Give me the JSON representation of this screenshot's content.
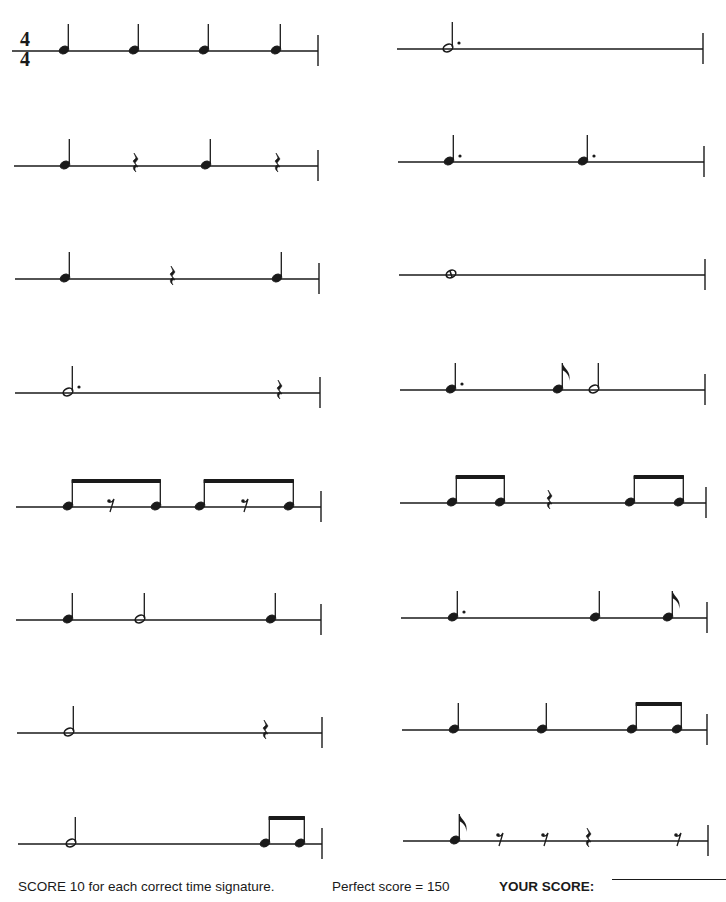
{
  "worksheet": {
    "time_signature": {
      "top": "4",
      "bottom": "4"
    },
    "footer": {
      "instruction": "SCORE 10 for each correct time signature.",
      "perfect_score": "Perfect score = 150",
      "your_score_label": "YOUR SCORE:"
    },
    "columns": [
      {
        "name": "left",
        "measures": [
          {
            "y": 51,
            "x1": 12,
            "x2": 318,
            "items": [
              {
                "t": "q",
                "x": 64
              },
              {
                "t": "q",
                "x": 134
              },
              {
                "t": "q",
                "x": 204
              },
              {
                "t": "q",
                "x": 276
              }
            ]
          },
          {
            "y": 166,
            "x1": 14,
            "x2": 318,
            "items": [
              {
                "t": "q",
                "x": 65
              },
              {
                "t": "qr",
                "x": 135
              },
              {
                "t": "q",
                "x": 206
              },
              {
                "t": "qr",
                "x": 277
              }
            ]
          },
          {
            "y": 279,
            "x1": 15,
            "x2": 319,
            "items": [
              {
                "t": "q",
                "x": 65
              },
              {
                "t": "qr",
                "x": 172
              },
              {
                "t": "q",
                "x": 277
              }
            ]
          },
          {
            "y": 393,
            "x1": 15,
            "x2": 320,
            "items": [
              {
                "t": "hd",
                "x": 68
              },
              {
                "t": "qr",
                "x": 279
              }
            ]
          },
          {
            "y": 507,
            "x1": 16,
            "x2": 321,
            "items": [
              {
                "t": "beam",
                "notes": [
                  68,
                  156
                ],
                "rest": {
                  "t": "er",
                  "x": 111
                }
              },
              {
                "t": "beam",
                "notes": [
                  200,
                  289
                ],
                "rest": {
                  "t": "er",
                  "x": 245
                }
              }
            ]
          },
          {
            "y": 620,
            "x1": 16,
            "x2": 321,
            "items": [
              {
                "t": "q",
                "x": 68
              },
              {
                "t": "h",
                "x": 140
              },
              {
                "t": "q",
                "x": 271
              }
            ]
          },
          {
            "y": 733,
            "x1": 17,
            "x2": 322,
            "items": [
              {
                "t": "h",
                "x": 69
              },
              {
                "t": "qr",
                "x": 265
              }
            ]
          },
          {
            "y": 844,
            "x1": 18,
            "x2": 322,
            "items": [
              {
                "t": "h",
                "x": 71
              },
              {
                "t": "beam",
                "notes": [
                  265,
                  300
                ]
              }
            ]
          }
        ]
      },
      {
        "name": "right",
        "measures": [
          {
            "y": 49,
            "x1": 397,
            "x2": 703,
            "items": [
              {
                "t": "hd",
                "x": 448
              }
            ]
          },
          {
            "y": 162,
            "x1": 398,
            "x2": 704,
            "items": [
              {
                "t": "qd",
                "x": 449
              },
              {
                "t": "qd",
                "x": 583
              }
            ]
          },
          {
            "y": 275,
            "x1": 399,
            "x2": 705,
            "items": [
              {
                "t": "w",
                "x": 451
              }
            ]
          },
          {
            "y": 390,
            "x1": 400,
            "x2": 705,
            "items": [
              {
                "t": "qd",
                "x": 451
              },
              {
                "t": "e",
                "x": 558
              },
              {
                "t": "h",
                "x": 594
              }
            ]
          },
          {
            "y": 503,
            "x1": 400,
            "x2": 706,
            "items": [
              {
                "t": "beam",
                "notes": [
                  452,
                  500
                ]
              },
              {
                "t": "qr",
                "x": 549
              },
              {
                "t": "beam",
                "notes": [
                  630,
                  679
                ]
              }
            ]
          },
          {
            "y": 618,
            "x1": 401,
            "x2": 707,
            "items": [
              {
                "t": "qd",
                "x": 453
              },
              {
                "t": "q",
                "x": 595
              },
              {
                "t": "e",
                "x": 668
              }
            ]
          },
          {
            "y": 730,
            "x1": 402,
            "x2": 707,
            "items": [
              {
                "t": "q",
                "x": 454
              },
              {
                "t": "q",
                "x": 542
              },
              {
                "t": "beam",
                "notes": [
                  632,
                  677
                ]
              }
            ]
          },
          {
            "y": 841,
            "x1": 403,
            "x2": 708,
            "items": [
              {
                "t": "e",
                "x": 455
              },
              {
                "t": "er",
                "x": 500
              },
              {
                "t": "er",
                "x": 545
              },
              {
                "t": "qr",
                "x": 588
              },
              {
                "t": "er",
                "x": 678
              }
            ]
          }
        ]
      }
    ],
    "legend": {
      "q": "quarter note",
      "qd": "dotted quarter note",
      "h": "half note",
      "hd": "dotted half note",
      "w": "whole note",
      "e": "eighth note",
      "beam": "beamed eighth notes",
      "qr": "quarter rest",
      "er": "eighth rest"
    },
    "colors": {
      "ink": "#1a1a1a",
      "paper": "#ffffff"
    }
  }
}
